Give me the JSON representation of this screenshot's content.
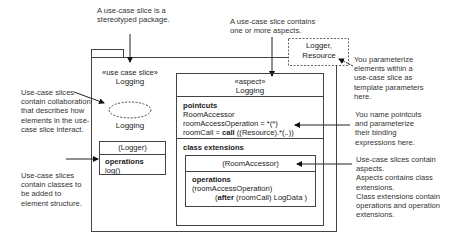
{
  "annotations": {
    "top_left": "A use-case slice is a\nstereotyped package.",
    "top_middle": "A use-case slice contains\none or more aspects.",
    "left_collab": "Use-case slices\ncontain collaboration\nthat describes how\nelements in the use-\ncase slice interact.",
    "left_classes": "Use-case slices\ncontain classes to\nbe added to\nelement structure.",
    "right_template": "You parameterize\nelements within a\nuse-case slice as\ntemplate parameters\nhere.",
    "right_pointcuts": "You name pointcuts\nand parameterize\ntheir binding\nexpressions here.",
    "right_aspects": "Use-case slices contain\naspects.\nAspects contains class\nextensions.\nClass extensions contain\noperations and operation\nextensions."
  },
  "template_params": "Logger,\nResource",
  "package": {
    "stereotype": "«use case slice»",
    "name": "Logging"
  },
  "collaboration": {
    "name": "Logging"
  },
  "logger_class": {
    "name": "(Logger)",
    "section_title": "operations",
    "operation": "log()"
  },
  "aspect": {
    "stereotype": "«aspect»",
    "name": "Logging",
    "pointcuts_title": "pointcuts",
    "pointcuts": {
      "line1": "RoomAccessor",
      "line2": "roomAccessOperation = *(*)",
      "line3_prefix": "roomCall = ",
      "line3_keyword": "call",
      "line3_suffix": " ((Resource).*(..))"
    },
    "class_extensions_title": "class extensions",
    "extension": {
      "name": "(RoomAccessor)",
      "operations_title": "operations",
      "op_line1": "(roomAccessOperation)",
      "op_line2_open": "(",
      "op_line2_keyword": "after",
      "op_line2_rest": " (roomCall) LogData )"
    }
  }
}
